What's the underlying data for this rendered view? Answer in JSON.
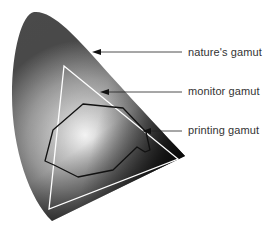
{
  "labels": {
    "nature": "nature's gamut",
    "monitor": "monitor gamut",
    "printing": "printing gamut"
  },
  "colors": {
    "horseshoe_dark": "#1a1a1a",
    "horseshoe_mid": "#9a9a9a",
    "center_highlight": "#ffffff",
    "triangle_stroke": "#ffffff",
    "printing_stroke": "#111111",
    "arrow": "#222222"
  }
}
